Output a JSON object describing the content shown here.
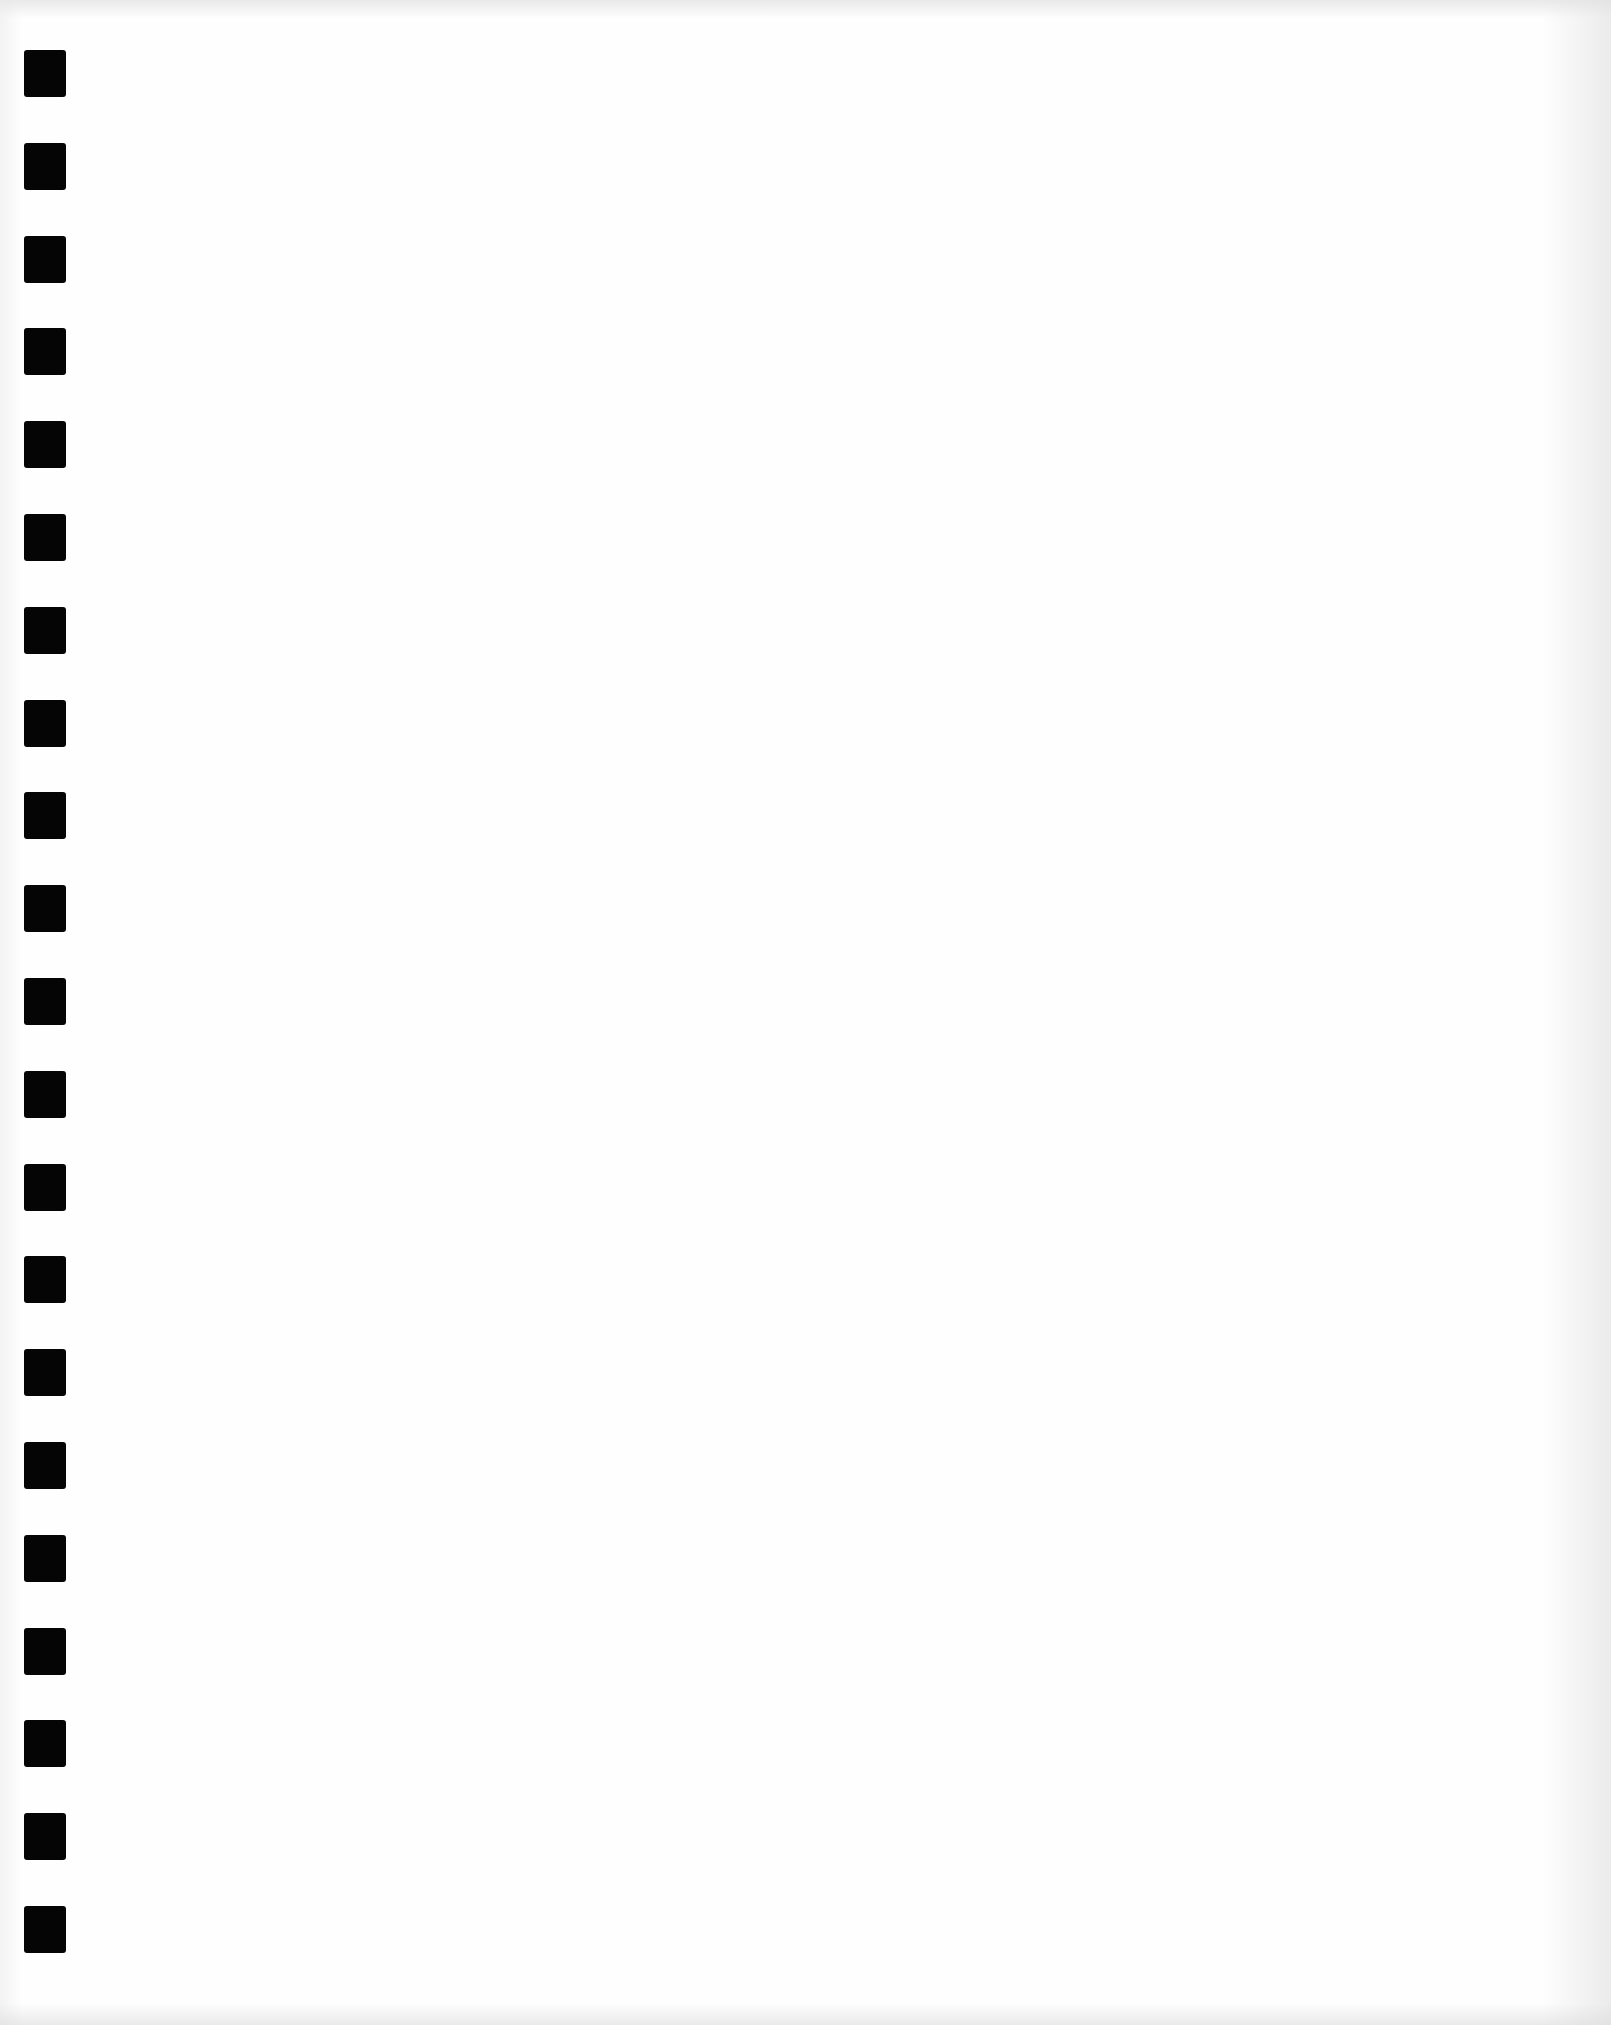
{
  "document": {
    "type": "blank scanned page",
    "content_text": "",
    "background_color": "#fefefe"
  },
  "binding": {
    "hole_count": 21,
    "hole_color": "#050505",
    "hole_width_px": 42,
    "hole_height_px": 47,
    "first_hole_top_px": 50,
    "hole_pitch_px": 92.8
  }
}
